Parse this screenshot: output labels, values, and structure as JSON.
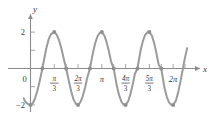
{
  "figure": {
    "title": "",
    "background_color": "#ffffff",
    "curve_color": "#9b9b9b",
    "axis_color": "#8a8a8a",
    "label_color": "#3a3a3a"
  },
  "axes": {
    "x_axis_label": "x",
    "y_axis_label": "y",
    "origin_label": "0",
    "y_ticks": [
      {
        "label": "2",
        "value": 2
      },
      {
        "label": "−2",
        "value": -2
      }
    ],
    "x_ticks": [
      {
        "label": "",
        "numerator": "π",
        "denominator": "3",
        "value": 1.0471975512,
        "is_fraction": true
      },
      {
        "label": "",
        "numerator": "2π",
        "denominator": "3",
        "value": 2.0943951024,
        "is_fraction": true
      },
      {
        "label": "π",
        "value": 3.1415926536,
        "is_fraction": false
      },
      {
        "label": "",
        "numerator": "4π",
        "denominator": "3",
        "value": 4.1887902048,
        "is_fraction": true
      },
      {
        "label": "",
        "numerator": "5π",
        "denominator": "3",
        "value": 5.235987756,
        "is_fraction": true
      },
      {
        "label": "2π",
        "value": 6.2831853072,
        "is_fraction": false
      }
    ],
    "minor_x_ticks": [
      0.5235987756,
      1.5707963268,
      2.617993878,
      3.6651914292,
      4.7123889804,
      5.7595865316,
      6.8067840828
    ],
    "minor_y_ticks": [
      1,
      -1
    ]
  },
  "chart_data": {
    "type": "line",
    "title": "",
    "xlabel": "x",
    "ylabel": "y",
    "xlim": [
      -0.35,
      7.05
    ],
    "ylim": [
      -2.55,
      2.55
    ],
    "grid": false,
    "legend": null,
    "equation": "y = -2cos(3x)",
    "amplitude": 2,
    "period": 2.0943951024,
    "series": [
      {
        "name": "y = -2cos(3x)",
        "color": "#9b9b9b",
        "x": [
          -0.3,
          -0.25,
          -0.2,
          -0.15,
          -0.1,
          -0.05,
          0.0,
          0.1,
          0.2,
          0.3,
          0.4,
          0.5236,
          0.6,
          0.7,
          0.8,
          0.9,
          1.0472,
          1.15,
          1.25,
          1.35,
          1.45,
          1.5708,
          1.7,
          1.8,
          1.9,
          2.0,
          2.0944,
          2.2,
          2.3,
          2.4,
          2.5,
          2.618,
          2.75,
          2.85,
          2.95,
          3.05,
          3.1416,
          3.25,
          3.35,
          3.45,
          3.55,
          3.6652,
          3.8,
          3.9,
          4.0,
          4.1,
          4.1888,
          4.3,
          4.4,
          4.5,
          4.6,
          4.7124,
          4.85,
          4.95,
          5.05,
          5.15,
          5.236,
          5.35,
          5.45,
          5.55,
          5.65,
          5.7596,
          5.9,
          6.0,
          6.1,
          6.2,
          6.2832,
          6.4,
          6.5,
          6.6,
          6.7,
          6.8,
          6.9
        ],
        "y": [
          -1.63,
          -1.77,
          -1.86,
          -1.91,
          -1.96,
          -1.99,
          -2.0,
          -1.91,
          -1.65,
          -1.24,
          -0.71,
          0.0,
          0.51,
          1.13,
          1.6,
          1.89,
          2.0,
          1.86,
          1.58,
          1.15,
          0.62,
          0.0,
          -0.74,
          -1.29,
          -1.71,
          -1.94,
          -2.0,
          -1.85,
          -1.53,
          -1.07,
          -0.51,
          0.0,
          0.86,
          1.39,
          1.77,
          1.96,
          2.0,
          1.82,
          1.46,
          0.96,
          0.38,
          0.0,
          -0.94,
          -1.45,
          -1.81,
          -1.98,
          -2.0,
          -1.81,
          -1.42,
          -0.89,
          -0.29,
          0.0,
          1.0,
          1.5,
          1.84,
          1.99,
          2.0,
          1.8,
          1.38,
          0.82,
          0.19,
          0.0,
          -1.05,
          -1.54,
          -1.86,
          -1.99,
          -2.0,
          -1.78,
          -1.34,
          -0.75,
          -0.1,
          0.56,
          1.12
        ]
      }
    ],
    "marked_points": [
      {
        "x": 0.0,
        "y": -2
      },
      {
        "x": 0.5236,
        "y": 0
      },
      {
        "x": 1.0472,
        "y": 2
      },
      {
        "x": 1.5708,
        "y": 0
      },
      {
        "x": 2.0944,
        "y": -2
      },
      {
        "x": 2.618,
        "y": 0
      },
      {
        "x": 3.1416,
        "y": 2
      },
      {
        "x": 3.6652,
        "y": 0
      },
      {
        "x": 4.1888,
        "y": -2
      },
      {
        "x": 4.7124,
        "y": 0
      },
      {
        "x": 5.236,
        "y": 2
      },
      {
        "x": 5.7596,
        "y": 0
      },
      {
        "x": 6.2832,
        "y": -2
      }
    ]
  }
}
